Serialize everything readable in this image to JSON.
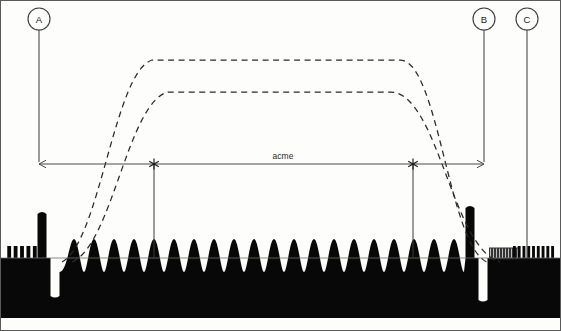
{
  "figure": {
    "background_color": "#fdfdfb",
    "ink_color": "#080808",
    "line_color": "#3a3a3a",
    "width": 561,
    "height": 331
  },
  "callouts": [
    {
      "id": "A",
      "label": "A",
      "x": 39,
      "circle_y": 19,
      "radius": 11,
      "stem_bottom": 162
    },
    {
      "id": "B",
      "label": "B",
      "x": 484,
      "circle_y": 19,
      "radius": 11,
      "stem_bottom": 162
    },
    {
      "id": "C",
      "label": "C",
      "x": 527,
      "circle_y": 19,
      "radius": 11,
      "stem_bottom": 258
    }
  ],
  "dimension": {
    "label": "acme",
    "label_x": 283,
    "label_y": 159,
    "y": 164,
    "x_start": 39,
    "x_end": 484,
    "arrow_size": 5
  },
  "markers": [
    {
      "name": "left-star-marker",
      "x": 154,
      "y": 164,
      "leader_bottom": 258
    },
    {
      "name": "right-star-marker",
      "x": 413,
      "y": 164,
      "leader_bottom": 258
    }
  ],
  "envelopes": [
    {
      "name": "outer-envelope",
      "style": "dashed",
      "plateau_y": 60,
      "rise_start_x": 62,
      "rise_end_x": 152,
      "fall_start_x": 400,
      "fall_end_x": 487,
      "base_y": 262
    },
    {
      "name": "inner-envelope",
      "style": "dashed",
      "plateau_y": 92,
      "rise_start_x": 72,
      "rise_end_x": 168,
      "fall_start_x": 390,
      "fall_end_x": 500,
      "base_y": 262
    }
  ],
  "waveform": {
    "name": "acme-waveform",
    "baseline_y": 258,
    "bottom_y": 318,
    "left_spike": {
      "x": 42,
      "top_y": 214,
      "width": 9
    },
    "left_gap": {
      "x": 55,
      "bottom_y": 296,
      "width": 9
    },
    "right_spike": {
      "x": 470,
      "top_y": 208,
      "width": 9
    },
    "right_gap": {
      "x": 483,
      "bottom_y": 300,
      "width": 9
    },
    "bump_count": 20,
    "bump_region": {
      "x_start": 64,
      "x_end": 464
    },
    "bump_top_y": 239,
    "bump_trough_y": 272
  },
  "pulse_trains": [
    {
      "name": "left-pulse-train",
      "count": 5,
      "x_start": 6,
      "x_end": 38,
      "top_y": 246,
      "base_y": 259,
      "filled": true
    },
    {
      "name": "right-pulse-train-outline",
      "count": 10,
      "x_start": 489,
      "x_end": 519,
      "top_y": 248,
      "base_y": 259,
      "filled": false
    },
    {
      "name": "right-pulse-train-filled",
      "count": 9,
      "x_start": 512,
      "x_end": 555,
      "top_y": 246,
      "base_y": 259,
      "filled": true
    }
  ],
  "frame": {
    "name": "figure-border",
    "x": 0.5,
    "y": 0.5,
    "width": 560,
    "height": 330,
    "stroke": "#5a5a5a"
  }
}
